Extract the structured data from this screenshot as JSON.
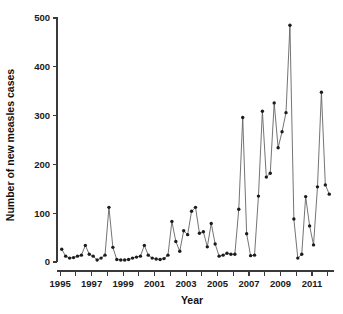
{
  "chart_data": {
    "type": "line",
    "title": "",
    "subtitle": "",
    "xlabel": "Year",
    "ylabel": "Number of new measles cases",
    "xlim": [
      1994.8,
      2012.4
    ],
    "ylim": [
      0,
      500
    ],
    "grid": false,
    "legend": null,
    "legend_position": "none",
    "y_ticks": [
      0,
      100,
      200,
      300,
      400,
      500
    ],
    "y_tick_labels": [
      "0",
      "100",
      "200",
      "300",
      "400",
      "500"
    ],
    "x_ticks": [
      1995,
      1996,
      1997,
      1998,
      1999,
      2000,
      2001,
      2002,
      2003,
      2004,
      2005,
      2006,
      2007,
      2008,
      2009,
      2010,
      2011,
      2012
    ],
    "x_tick_labels": [
      "1995",
      "",
      "1997",
      "",
      "1999",
      "",
      "2001",
      "",
      "2003",
      "",
      "2005",
      "",
      "2007",
      "",
      "2009",
      "",
      "2011",
      ""
    ],
    "marker": "filled-circle",
    "marker_color": "#1c1c1c",
    "line_color": "#5b5b5b",
    "series": [
      {
        "name": "New measles cases",
        "x": [
          1995.1,
          1995.35,
          1995.6,
          1995.85,
          1996.1,
          1996.35,
          1996.6,
          1996.85,
          1997.1,
          1997.35,
          1997.6,
          1997.85,
          1998.1,
          1998.35,
          1998.6,
          1998.85,
          1999.1,
          1999.35,
          1999.6,
          1999.85,
          2000.1,
          2000.35,
          2000.6,
          2000.85,
          2001.1,
          2001.35,
          2001.6,
          2001.85,
          2002.1,
          2002.35,
          2002.6,
          2002.85,
          2003.1,
          2003.35,
          2003.6,
          2003.85,
          2004.1,
          2004.35,
          2004.6,
          2004.85,
          2005.1,
          2005.35,
          2005.6,
          2005.85,
          2006.1,
          2006.35,
          2006.6,
          2006.85,
          2007.1,
          2007.35,
          2007.6,
          2007.85,
          2008.1,
          2008.35,
          2008.6,
          2008.85,
          2009.1,
          2009.35,
          2009.6,
          2009.85,
          2010.1,
          2010.35,
          2010.6,
          2010.85,
          2011.1,
          2011.35,
          2011.6,
          2011.85,
          2012.1
        ],
        "values": [
          26,
          12,
          8,
          9,
          12,
          14,
          34,
          16,
          12,
          4,
          8,
          14,
          112,
          30,
          5,
          4,
          4,
          5,
          8,
          10,
          12,
          34,
          14,
          8,
          6,
          5,
          7,
          14,
          83,
          42,
          22,
          64,
          56,
          104,
          112,
          59,
          62,
          31,
          79,
          37,
          12,
          14,
          18,
          16,
          16,
          108,
          296,
          58,
          13,
          14,
          135,
          309,
          174,
          182,
          326,
          234,
          267,
          306,
          485,
          88,
          8,
          16,
          134,
          74,
          35,
          154,
          348,
          158,
          139
        ]
      }
    ]
  },
  "axes": {
    "x_title": "Year",
    "y_title": "Number of new measles cases"
  }
}
